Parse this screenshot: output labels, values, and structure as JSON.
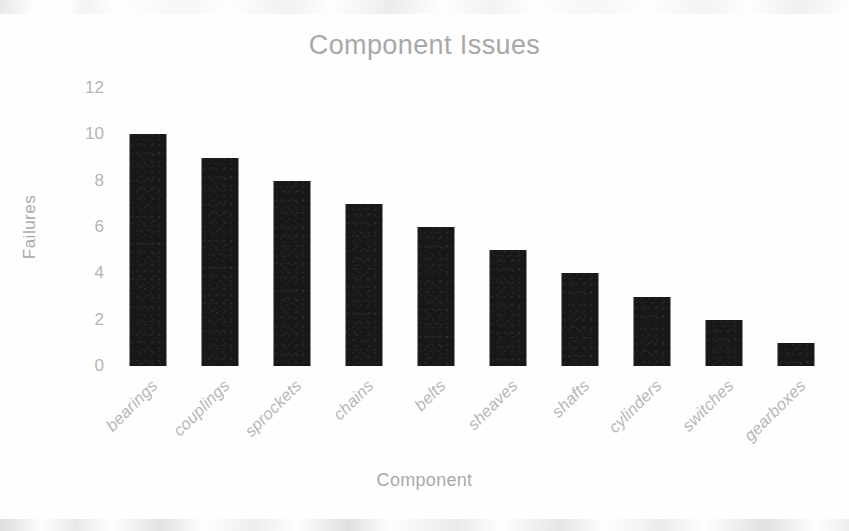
{
  "chart_data": {
    "type": "bar",
    "title": "Component Issues",
    "xlabel": "Component",
    "ylabel": "Failures",
    "categories": [
      "bearings",
      "couplings",
      "sprockets",
      "chains",
      "belts",
      "sheaves",
      "shafts",
      "cylinders",
      "switches",
      "gearboxes"
    ],
    "values": [
      10,
      9,
      8,
      7,
      6,
      5,
      4,
      3,
      2,
      1
    ],
    "ylim": [
      0,
      12
    ],
    "ytick_labels": [
      "12",
      "10",
      "8",
      "6",
      "4",
      "2",
      "0"
    ],
    "ytick_values": [
      12,
      10,
      8,
      6,
      4,
      2,
      0
    ],
    "grid": false,
    "legend": false,
    "legend_position": "none",
    "bar_color": "#181818",
    "text_color": "#b0b0b0",
    "background_color": "#ffffff",
    "orientation": "vertical",
    "sorted": "descending"
  }
}
